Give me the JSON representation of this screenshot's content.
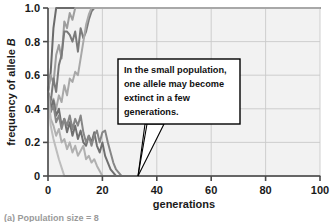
{
  "figure": {
    "background_color": "#ffffff",
    "plot_background_color": "#f2f2f2",
    "grid_color": "#c9c9c9",
    "axis_color": "#4a4a4a"
  },
  "callout": {
    "line1": "In the small population,",
    "line2": "one allele may become",
    "line3": "extinct in a few",
    "line4": "generations.",
    "border_color": "#000000",
    "fill_color": "#ffffff"
  },
  "caption": {
    "text": "(a) Population size = 8"
  },
  "chart_data": {
    "type": "line",
    "title": "",
    "xlabel": "generations",
    "ylabel": "frequency of allele B",
    "ylabel_plain": "frequency of allele",
    "ylabel_italic": "B",
    "xlim": [
      0,
      100
    ],
    "ylim": [
      0,
      1.0
    ],
    "xticks": [
      0,
      20,
      40,
      60,
      80,
      100
    ],
    "xtick_labels": [
      "0",
      "20",
      "40",
      "60",
      "80",
      "100"
    ],
    "yticks": [
      0,
      0.2,
      0.4,
      0.6,
      0.8,
      1.0
    ],
    "ytick_labels": [
      "0",
      "0.2",
      "0.4",
      "0.6",
      "0.8",
      "1.0"
    ],
    "grid": true,
    "legend": "none",
    "series": [
      {
        "name": "replicate-1",
        "color": "#6b6b6b",
        "width": 2.0,
        "points": [
          [
            0,
            0.5
          ],
          [
            1,
            0.62
          ],
          [
            2,
            0.88
          ],
          [
            3,
            1.0
          ],
          [
            4,
            1.0
          ],
          [
            5,
            1.0
          ],
          [
            6,
            1.0
          ],
          [
            8,
            1.0
          ],
          [
            10,
            1.0
          ],
          [
            14,
            1.0
          ],
          [
            20,
            1.0
          ],
          [
            30,
            1.0
          ],
          [
            50,
            1.0
          ],
          [
            70,
            1.0
          ],
          [
            100,
            1.0
          ]
        ]
      },
      {
        "name": "replicate-2",
        "color": "#9e9e9e",
        "width": 2.0,
        "points": [
          [
            0,
            0.5
          ],
          [
            1,
            0.6
          ],
          [
            2,
            0.55
          ],
          [
            3,
            0.72
          ],
          [
            4,
            0.78
          ],
          [
            5,
            0.7
          ],
          [
            6,
            0.92
          ],
          [
            7,
            0.88
          ],
          [
            8,
            0.97
          ],
          [
            9,
            0.93
          ],
          [
            10,
            1.0
          ],
          [
            12,
            1.0
          ],
          [
            16,
            1.0
          ],
          [
            20,
            1.0
          ],
          [
            40,
            1.0
          ],
          [
            70,
            1.0
          ],
          [
            100,
            1.0
          ]
        ]
      },
      {
        "name": "replicate-3",
        "color": "#7a7a7a",
        "width": 2.0,
        "points": [
          [
            0,
            0.5
          ],
          [
            1,
            0.44
          ],
          [
            2,
            0.58
          ],
          [
            3,
            0.5
          ],
          [
            4,
            0.66
          ],
          [
            5,
            0.72
          ],
          [
            6,
            0.86
          ],
          [
            7,
            0.86
          ],
          [
            8,
            0.84
          ],
          [
            9,
            0.8
          ],
          [
            10,
            0.86
          ],
          [
            11,
            0.74
          ],
          [
            12,
            0.88
          ],
          [
            13,
            0.82
          ],
          [
            14,
            0.86
          ],
          [
            15,
            0.93
          ],
          [
            16,
            0.98
          ],
          [
            17,
            1.0
          ],
          [
            19,
            1.0
          ],
          [
            24,
            1.0
          ],
          [
            40,
            1.0
          ],
          [
            70,
            1.0
          ],
          [
            100,
            1.0
          ]
        ]
      },
      {
        "name": "replicate-4",
        "color": "#a8a8a8",
        "width": 2.0,
        "points": [
          [
            0,
            0.5
          ],
          [
            1,
            0.42
          ],
          [
            2,
            0.46
          ],
          [
            3,
            0.4
          ],
          [
            4,
            0.48
          ],
          [
            5,
            0.44
          ],
          [
            6,
            0.54
          ],
          [
            7,
            0.48
          ],
          [
            8,
            0.58
          ],
          [
            9,
            0.56
          ],
          [
            10,
            0.62
          ],
          [
            11,
            0.6
          ],
          [
            12,
            0.7
          ],
          [
            13,
            0.8
          ],
          [
            14,
            0.9
          ],
          [
            15,
            0.96
          ],
          [
            16,
            1.0
          ],
          [
            18,
            1.0
          ],
          [
            22,
            1.0
          ],
          [
            45,
            1.0
          ],
          [
            80,
            1.0
          ],
          [
            100,
            1.0
          ]
        ]
      },
      {
        "name": "replicate-5",
        "color": "#707070",
        "width": 2.0,
        "points": [
          [
            0,
            0.5
          ],
          [
            1,
            0.4
          ],
          [
            2,
            0.45
          ],
          [
            3,
            0.36
          ],
          [
            4,
            0.4
          ],
          [
            5,
            0.3
          ],
          [
            6,
            0.34
          ],
          [
            7,
            0.26
          ],
          [
            8,
            0.32
          ],
          [
            9,
            0.24
          ],
          [
            10,
            0.3
          ],
          [
            11,
            0.22
          ],
          [
            12,
            0.27
          ],
          [
            13,
            0.2
          ],
          [
            14,
            0.18
          ],
          [
            15,
            0.24
          ],
          [
            16,
            0.2
          ],
          [
            17,
            0.26
          ],
          [
            18,
            0.18
          ],
          [
            19,
            0.14
          ],
          [
            20,
            0.2
          ],
          [
            21,
            0.12
          ],
          [
            22,
            0.08
          ],
          [
            23,
            0.04
          ],
          [
            24,
            0.02
          ],
          [
            25,
            0.0
          ],
          [
            30,
            0.0
          ],
          [
            45,
            0.0
          ],
          [
            70,
            0.0
          ],
          [
            100,
            0.0
          ]
        ]
      },
      {
        "name": "replicate-6",
        "color": "#868686",
        "width": 2.0,
        "points": [
          [
            0,
            0.5
          ],
          [
            1,
            0.38
          ],
          [
            2,
            0.42
          ],
          [
            3,
            0.32
          ],
          [
            4,
            0.36
          ],
          [
            5,
            0.28
          ],
          [
            6,
            0.34
          ],
          [
            7,
            0.3
          ],
          [
            8,
            0.36
          ],
          [
            9,
            0.28
          ],
          [
            10,
            0.34
          ],
          [
            11,
            0.3
          ],
          [
            12,
            0.36
          ],
          [
            13,
            0.26
          ],
          [
            14,
            0.2
          ],
          [
            15,
            0.24
          ],
          [
            16,
            0.18
          ],
          [
            17,
            0.24
          ],
          [
            18,
            0.27
          ],
          [
            19,
            0.2
          ],
          [
            20,
            0.26
          ],
          [
            21,
            0.27
          ],
          [
            22,
            0.2
          ],
          [
            23,
            0.14
          ],
          [
            24,
            0.08
          ],
          [
            25,
            0.04
          ],
          [
            26,
            0.02
          ],
          [
            27,
            0.0
          ],
          [
            32,
            0.0
          ],
          [
            50,
            0.0
          ],
          [
            80,
            0.0
          ],
          [
            100,
            0.0
          ]
        ]
      },
      {
        "name": "replicate-7",
        "color": "#b0b0b0",
        "width": 2.0,
        "points": [
          [
            0,
            0.5
          ],
          [
            1,
            0.34
          ],
          [
            2,
            0.3
          ],
          [
            3,
            0.24
          ],
          [
            4,
            0.28
          ],
          [
            5,
            0.2
          ],
          [
            6,
            0.22
          ],
          [
            7,
            0.16
          ],
          [
            8,
            0.2
          ],
          [
            9,
            0.14
          ],
          [
            10,
            0.18
          ],
          [
            11,
            0.12
          ],
          [
            12,
            0.15
          ],
          [
            13,
            0.18
          ],
          [
            14,
            0.1
          ],
          [
            15,
            0.12
          ],
          [
            16,
            0.08
          ],
          [
            17,
            0.1
          ],
          [
            18,
            0.06
          ],
          [
            19,
            0.03
          ],
          [
            20,
            0.0
          ],
          [
            26,
            0.0
          ],
          [
            45,
            0.0
          ],
          [
            75,
            0.0
          ],
          [
            100,
            0.0
          ]
        ]
      },
      {
        "name": "replicate-8",
        "color": "#bdbdbd",
        "width": 2.0,
        "points": [
          [
            0,
            0.5
          ],
          [
            1,
            0.3
          ],
          [
            2,
            0.22
          ],
          [
            3,
            0.16
          ],
          [
            4,
            0.1
          ],
          [
            5,
            0.05
          ],
          [
            6,
            0.0
          ],
          [
            10,
            0.0
          ],
          [
            20,
            0.0
          ],
          [
            40,
            0.0
          ],
          [
            70,
            0.0
          ],
          [
            100,
            0.0
          ]
        ]
      }
    ]
  }
}
